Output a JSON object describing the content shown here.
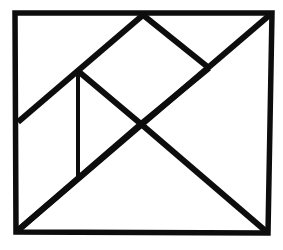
{
  "figure": {
    "type": "geometric-line-drawing",
    "background_color": "#ffffff",
    "stroke_color": "#0d0d0d",
    "canvas": {
      "width": 283,
      "height": 250
    },
    "outer_square": {
      "name": "outer-square-frame",
      "stroke_width": 5.5,
      "points": "15,13 272,13 268,233 16,232",
      "corners": {
        "top_left": {
          "x": 15,
          "y": 13
        },
        "top_right": {
          "x": 272,
          "y": 13
        },
        "bottom_right": {
          "x": 268,
          "y": 233
        },
        "bottom_left": {
          "x": 16,
          "y": 232
        }
      }
    },
    "key_points": {
      "top_apex": {
        "x": 143,
        "y": 15,
        "label": "top-apex"
      },
      "left_point": {
        "x": 18,
        "y": 122,
        "label": "left-edge-point"
      },
      "upper_junction": {
        "x": 78,
        "y": 71,
        "label": "upper-junction"
      },
      "center_cross": {
        "x": 141,
        "y": 124,
        "label": "center-cross"
      },
      "right_vertex": {
        "x": 209,
        "y": 68,
        "label": "right-diamond-vertex"
      },
      "vertical_bottom": {
        "x": 78,
        "y": 180,
        "label": "vertical-line-foot"
      }
    },
    "lines": [
      {
        "name": "main-diagonal",
        "description": "Long diagonal from bottom-left corner to top-right corner",
        "points": "16,232 272,13",
        "stroke_width": 6
      },
      {
        "name": "upper-left-diagonal",
        "description": "Diagonal from left edge up through junction to top apex",
        "points": "18,122 143,15",
        "stroke_width": 6
      },
      {
        "name": "junction-to-center-diagonal",
        "description": "Diagonal from upper junction down-right to center cross",
        "points": "78,71 141,124",
        "stroke_width": 6
      },
      {
        "name": "apex-to-right-vertex-diagonal",
        "description": "Diagonal from top apex down-right to right diamond vertex",
        "points": "143,15 209,68",
        "stroke_width": 6
      },
      {
        "name": "right-vertex-to-center-diagonal",
        "description": "Diagonal from right diamond vertex down-left to center cross",
        "points": "209,68 141,124",
        "stroke_width": 6
      },
      {
        "name": "center-to-bottom-left-diagonal",
        "description": "Diagonal from center cross down-left to bottom-left corner",
        "points": "141,124 16,232",
        "stroke_width": 6
      },
      {
        "name": "center-to-bottom-right-diagonal",
        "description": "Diagonal from center cross down-right to bottom-right corner",
        "points": "141,124 268,233",
        "stroke_width": 6
      },
      {
        "name": "vertical-divider",
        "description": "Vertical line from upper junction down to lower diagonal",
        "points": "78,71 78,180",
        "stroke_width": 4
      }
    ]
  }
}
